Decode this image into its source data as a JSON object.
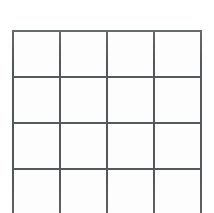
{
  "document": {
    "kind": "empty-grid",
    "description": "Blank four-column ruled grid, bottom row cut off by the image edge",
    "background_color": "#ffffff",
    "cell_fill_color": "#fdfdfd",
    "line_color": "#555a5c",
    "line_thickness_px": 2
  },
  "grid": {
    "columns": 4,
    "visible_rows": 4,
    "complete_rows": 3,
    "bottom_row_clipped": true,
    "column_x_px": [
      12,
      58,
      105,
      152,
      202
    ],
    "row_y_px": [
      30,
      76,
      122,
      168
    ],
    "cell_width_px": 47,
    "cell_height_px": 46,
    "rows": [
      {
        "cells": [
          "",
          "",
          "",
          ""
        ]
      },
      {
        "cells": [
          "",
          "",
          "",
          ""
        ]
      },
      {
        "cells": [
          "",
          "",
          "",
          ""
        ]
      },
      {
        "cells": [
          "",
          "",
          "",
          ""
        ]
      }
    ]
  },
  "margins": {
    "left_px": 12,
    "right_px": 12,
    "top_px": 30,
    "bottom_px": 0
  }
}
